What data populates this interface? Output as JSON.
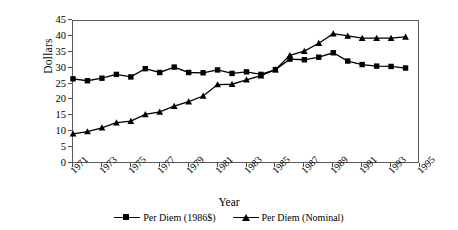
{
  "chart_data": {
    "type": "line",
    "title": "",
    "xlabel": "Year",
    "ylabel": "Dollars",
    "ylim": [
      0,
      45
    ],
    "yticks": [
      0,
      5,
      10,
      15,
      20,
      25,
      30,
      35,
      40,
      45
    ],
    "xlim": [
      1971,
      1995
    ],
    "xticks": [
      1971,
      1973,
      1975,
      1977,
      1979,
      1981,
      1983,
      1985,
      1987,
      1989,
      1991,
      1993,
      1995
    ],
    "grid": false,
    "legend_position": "bottom-center",
    "x": [
      1971,
      1972,
      1973,
      1974,
      1975,
      1976,
      1977,
      1978,
      1979,
      1980,
      1981,
      1982,
      1983,
      1984,
      1985,
      1986,
      1987,
      1988,
      1989,
      1990,
      1991,
      1992,
      1993,
      1994
    ],
    "series": [
      {
        "name": "Per Diem (1986$)",
        "marker": "square",
        "color": "#000000",
        "values": [
          26.8,
          26.2,
          27.0,
          28.2,
          27.4,
          30.0,
          28.8,
          30.5,
          28.8,
          28.7,
          29.6,
          28.5,
          29.0,
          28.2,
          29.7,
          33.0,
          32.8,
          33.6,
          35.0,
          32.4,
          31.3,
          30.8,
          30.7,
          30.2
        ]
      },
      {
        "name": "Per Diem (Nominal)",
        "marker": "triangle",
        "color": "#000000",
        "values": [
          9.5,
          10.2,
          11.4,
          13.0,
          13.5,
          15.6,
          16.4,
          18.2,
          19.6,
          21.4,
          25.0,
          25.1,
          26.5,
          27.8,
          29.7,
          34.2,
          35.5,
          38.0,
          41.0,
          40.3,
          39.6,
          39.6,
          39.6,
          40.0
        ]
      }
    ]
  },
  "axis": {
    "y_title": "Dollars",
    "x_title": "Year",
    "y_tick_labels": [
      "45",
      "40",
      "35",
      "30",
      "25",
      "20",
      "15",
      "10",
      "5",
      "0"
    ],
    "x_tick_labels": [
      "1971",
      "1973",
      "1975",
      "1977",
      "1979",
      "1981",
      "1983",
      "1985",
      "1987",
      "1989",
      "1991",
      "1993",
      "1995"
    ]
  },
  "legend": {
    "items": [
      {
        "label": "Per Diem (1986$)",
        "marker": "square-marker"
      },
      {
        "label": "Per Diem (Nominal)",
        "marker": "triangle-marker"
      }
    ]
  },
  "colors": {
    "series": "#000000",
    "frame": "#5b5b5b",
    "background": "#ffffff"
  }
}
